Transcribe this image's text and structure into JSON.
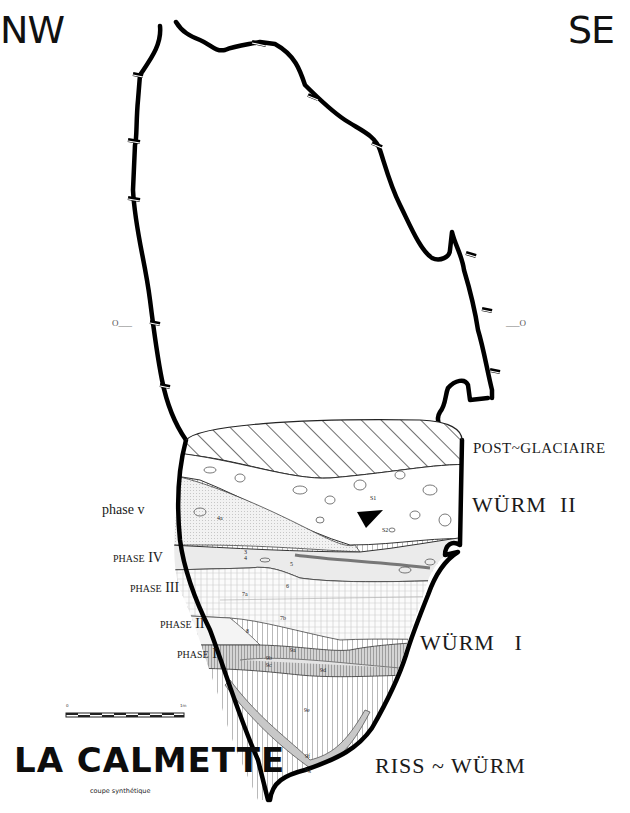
{
  "orientation": {
    "left": "NW",
    "right": "SE"
  },
  "title": "LA CALMETTE",
  "subtitle": "coupe synthétique",
  "periods": {
    "post_glaciaire": "POST~GLACIAIRE",
    "wurm_2": "WÜRM  II",
    "wurm_1": "WÜRM   I",
    "riss_wurm": "RISS ~ WÜRM"
  },
  "phases": {
    "v": "phase v",
    "iv": "phase IV",
    "iii": "phase III",
    "ii": "phase II",
    "i": "phase I"
  },
  "datum": {
    "left": "O___",
    "right": "___O"
  },
  "scale_bar": {
    "start": "0",
    "end": "1m"
  },
  "layer_labels": [
    "S1",
    "S2",
    "4a",
    "3",
    "4",
    "5",
    "6",
    "7a",
    "7b",
    "8",
    "9a",
    "9b",
    "9c",
    "9d",
    "9e",
    "9f",
    "9g"
  ],
  "colors": {
    "outline": "#000000",
    "background": "#ffffff",
    "stipple": "#e6e6e6",
    "band_grey": "#bdbdbd",
    "hatch": "#222222"
  }
}
